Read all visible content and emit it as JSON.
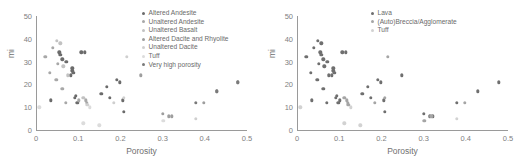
{
  "figure": {
    "panels": [
      {
        "id": "left",
        "xlabel": "Porosity",
        "ylabel": "mi",
        "xticks": [
          "0",
          "0.1",
          "0.2",
          "0.3",
          "0.4",
          "0.5"
        ],
        "yticks": [
          "0",
          "10",
          "20",
          "30",
          "40",
          "50"
        ],
        "legend": [
          {
            "label": "Altered Andesite",
            "color": "#6b6b6b"
          },
          {
            "label": "Unaltered Andesite",
            "color": "#a8a8a8"
          },
          {
            "label": "Unaltered Basalt",
            "color": "#c2c2c2"
          },
          {
            "label": "Altered Dacite and Rhyolite",
            "color": "#9e9e9e"
          },
          {
            "label": "Unaltered Dacite",
            "color": "#cfcfcf"
          },
          {
            "label": "Tuff",
            "color": "#dcdcdc"
          },
          {
            "label": "Very high porosity",
            "color": "#7a7a7a"
          }
        ]
      },
      {
        "id": "right",
        "xlabel": "Porosity",
        "ylabel": "mi",
        "xticks": [
          "0",
          "0.1",
          "0.2",
          "0.3",
          "0.4",
          "0.5"
        ],
        "yticks": [
          "0",
          "10",
          "20",
          "30",
          "40",
          "50"
        ],
        "legend": [
          {
            "label": "Lava",
            "color": "#6f6f6f"
          },
          {
            "label": "(Auto)Breccia/Agglomerate",
            "color": "#a5a5a5"
          },
          {
            "label": "Tuff",
            "color": "#d2d2d2"
          }
        ]
      }
    ]
  },
  "chart_data": [
    {
      "type": "scatter",
      "panel": "left",
      "title": "",
      "xlabel": "Porosity",
      "ylabel": "mi",
      "xlim": [
        0,
        0.5
      ],
      "ylim": [
        0,
        50
      ],
      "xticks": [
        0,
        0.1,
        0.2,
        0.3,
        0.4,
        0.5
      ],
      "yticks": [
        0,
        10,
        20,
        30,
        40,
        50
      ],
      "grid": false,
      "legend_position": "top-right",
      "series": [
        {
          "name": "Altered Andesite",
          "color": "#6b6b6b",
          "points": [
            [
              0.035,
              13
            ],
            [
              0.055,
              34
            ],
            [
              0.058,
              33
            ],
            [
              0.062,
              31
            ],
            [
              0.072,
              30
            ],
            [
              0.082,
              24
            ],
            [
              0.086,
              26
            ],
            [
              0.086,
              27
            ],
            [
              0.088,
              25
            ],
            [
              0.092,
              14
            ],
            [
              0.095,
              15
            ],
            [
              0.098,
              12
            ],
            [
              0.107,
              34
            ],
            [
              0.115,
              34
            ],
            [
              0.155,
              16
            ],
            [
              0.168,
              19
            ],
            [
              0.175,
              14
            ],
            [
              0.192,
              22
            ],
            [
              0.198,
              21
            ],
            [
              0.205,
              13
            ],
            [
              0.208,
              8
            ]
          ]
        },
        {
          "name": "Unaltered Andesite",
          "color": "#a8a8a8",
          "points": [
            [
              0.022,
              32
            ],
            [
              0.032,
              25
            ],
            [
              0.04,
              36
            ],
            [
              0.048,
              22
            ],
            [
              0.052,
              29
            ],
            [
              0.062,
              18
            ],
            [
              0.07,
              12
            ],
            [
              0.102,
              13
            ],
            [
              0.118,
              13
            ],
            [
              0.12,
              12
            ]
          ]
        },
        {
          "name": "Unaltered Basalt",
          "color": "#c2c2c2",
          "points": [
            [
              0.05,
              39
            ],
            [
              0.058,
              38
            ],
            [
              0.065,
              28
            ],
            [
              0.075,
              24
            ],
            [
              0.112,
              14
            ]
          ]
        },
        {
          "name": "Altered Dacite and Rhyolite",
          "color": "#9e9e9e",
          "points": [
            [
              0.248,
              24
            ],
            [
              0.3,
              7
            ],
            [
              0.315,
              6
            ],
            [
              0.322,
              6
            ],
            [
              0.398,
              12
            ],
            [
              0.428,
              17
            ],
            [
              0.478,
              21
            ]
          ]
        },
        {
          "name": "Unaltered Dacite",
          "color": "#cfcfcf",
          "points": [
            [
              0.122,
              11
            ],
            [
              0.185,
              12
            ],
            [
              0.208,
              14
            ],
            [
              0.215,
              32
            ],
            [
              0.378,
              5
            ]
          ]
        },
        {
          "name": "Tuff",
          "color": "#dcdcdc",
          "points": [
            [
              0.008,
              10
            ],
            [
              0.112,
              3
            ],
            [
              0.128,
              10
            ],
            [
              0.15,
              2
            ],
            [
              0.302,
              4
            ]
          ]
        },
        {
          "name": "Very high porosity",
          "color": "#7a7a7a",
          "points": [
            [
              0.378,
              12
            ],
            [
              0.428,
              17
            ],
            [
              0.478,
              21
            ]
          ]
        }
      ]
    },
    {
      "type": "scatter",
      "panel": "right",
      "title": "",
      "xlabel": "Porosity",
      "ylabel": "mi",
      "xlim": [
        0,
        0.5
      ],
      "ylim": [
        0,
        50
      ],
      "xticks": [
        0,
        0.1,
        0.2,
        0.3,
        0.4,
        0.5
      ],
      "yticks": [
        0,
        10,
        20,
        30,
        40,
        50
      ],
      "grid": false,
      "legend_position": "top-right",
      "series": [
        {
          "name": "Lava",
          "color": "#6f6f6f",
          "points": [
            [
              0.022,
              32
            ],
            [
              0.032,
              25
            ],
            [
              0.035,
              13
            ],
            [
              0.04,
              36
            ],
            [
              0.048,
              22
            ],
            [
              0.05,
              39
            ],
            [
              0.052,
              29
            ],
            [
              0.055,
              34
            ],
            [
              0.058,
              33
            ],
            [
              0.058,
              38
            ],
            [
              0.062,
              18
            ],
            [
              0.062,
              31
            ],
            [
              0.065,
              28
            ],
            [
              0.07,
              12
            ],
            [
              0.072,
              30
            ],
            [
              0.075,
              24
            ],
            [
              0.082,
              24
            ],
            [
              0.086,
              26
            ],
            [
              0.086,
              27
            ],
            [
              0.088,
              25
            ],
            [
              0.092,
              14
            ],
            [
              0.095,
              15
            ],
            [
              0.098,
              12
            ],
            [
              0.102,
              13
            ],
            [
              0.107,
              34
            ],
            [
              0.115,
              34
            ],
            [
              0.155,
              16
            ],
            [
              0.168,
              19
            ],
            [
              0.175,
              14
            ],
            [
              0.192,
              22
            ],
            [
              0.198,
              21
            ],
            [
              0.205,
              13
            ],
            [
              0.208,
              8
            ],
            [
              0.248,
              24
            ],
            [
              0.3,
              7
            ],
            [
              0.315,
              6
            ],
            [
              0.322,
              6
            ],
            [
              0.378,
              12
            ],
            [
              0.428,
              17
            ],
            [
              0.478,
              21
            ]
          ]
        },
        {
          "name": "(Auto)Breccia/Agglomerate",
          "color": "#a5a5a5",
          "points": [
            [
              0.112,
              14
            ],
            [
              0.118,
              13
            ],
            [
              0.12,
              12
            ],
            [
              0.122,
              11
            ],
            [
              0.185,
              12
            ],
            [
              0.208,
              14
            ],
            [
              0.215,
              32
            ],
            [
              0.302,
              4
            ],
            [
              0.318,
              6
            ],
            [
              0.398,
              12
            ]
          ]
        },
        {
          "name": "Tuff",
          "color": "#d2d2d2",
          "points": [
            [
              0.008,
              10
            ],
            [
              0.112,
              3
            ],
            [
              0.128,
              10
            ],
            [
              0.15,
              2
            ],
            [
              0.378,
              5
            ]
          ]
        }
      ]
    }
  ]
}
